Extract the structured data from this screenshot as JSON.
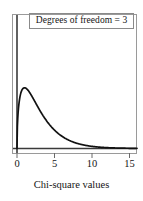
{
  "chart_data": {
    "type": "line",
    "title": "",
    "subtitle": "",
    "annotation": "Degrees of freedom = 3",
    "xlabel": "Chi-square values",
    "ylabel": "",
    "xlim": [
      0,
      16
    ],
    "ylim": [
      0,
      0.26
    ],
    "xticks": [
      {
        "value": 0,
        "label": "0",
        "px": 17
      },
      {
        "value": 5,
        "label": "5",
        "px": 54.5
      },
      {
        "value": 10,
        "label": "10",
        "px": 92
      },
      {
        "value": 15,
        "label": "15",
        "px": 129.5
      }
    ],
    "grid": false,
    "legend": null,
    "series": [
      {
        "name": "Chi-square density (df = 3)",
        "color": "#111111",
        "x": [
          0.0,
          0.1,
          0.2,
          0.3,
          0.4,
          0.5,
          0.7,
          0.9,
          1.0,
          1.2,
          1.4,
          1.6,
          1.8,
          2.0,
          2.5,
          3.0,
          3.5,
          4.0,
          4.5,
          5.0,
          5.5,
          6.0,
          6.5,
          7.0,
          7.5,
          8.0,
          9.0,
          10.0,
          11.0,
          12.0,
          13.0,
          14.0,
          15.0,
          16.0
        ],
        "y": [
          0.0,
          0.12,
          0.1614,
          0.1857,
          0.201,
          0.2104,
          0.219,
          0.2191,
          0.242,
          0.2143,
          0.2066,
          0.1974,
          0.1873,
          0.1769,
          0.1509,
          0.1266,
          0.105,
          0.0862,
          0.0701,
          0.0565,
          0.0453,
          0.0361,
          0.0286,
          0.0226,
          0.0177,
          0.0138,
          0.0083,
          0.0049,
          0.0029,
          0.0017,
          0.001,
          0.0006,
          0.0003,
          0.0002
        ]
      }
    ],
    "peak": {
      "x": 1.0,
      "y": 0.242
    }
  },
  "figure": {
    "frame_color": "#8a8a8a",
    "axis_color": "#2a2a2a",
    "curve_color": "#111111",
    "background": "#ffffff"
  }
}
